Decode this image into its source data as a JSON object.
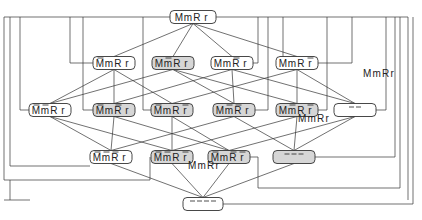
{
  "diagram": {
    "type": "hasse-lattice",
    "colors": {
      "white_node": "#ffffff",
      "gray_node": "#d6d6d6",
      "line": "#333333"
    },
    "nodes": [
      {
        "id": "top",
        "label": "MmRr",
        "bars": [
          0,
          0,
          0,
          0
        ],
        "x": 193,
        "y": 17,
        "w": 46,
        "fill": "white"
      },
      {
        "id": "n1",
        "label": "MmRr",
        "bars": [
          1,
          0,
          0,
          0
        ],
        "x": 114,
        "y": 63,
        "w": 42,
        "fill": "white"
      },
      {
        "id": "n2",
        "label": "MmRr",
        "bars": [
          0,
          1,
          0,
          0
        ],
        "x": 173,
        "y": 63,
        "w": 42,
        "fill": "gray"
      },
      {
        "id": "n3",
        "label": "MmRr",
        "bars": [
          0,
          0,
          1,
          0
        ],
        "x": 232,
        "y": 63,
        "w": 42,
        "fill": "white"
      },
      {
        "id": "n4",
        "label": "MmRr",
        "bars": [
          0,
          0,
          0,
          1
        ],
        "x": 297,
        "y": 63,
        "w": 42,
        "fill": "white"
      },
      {
        "id": "n5",
        "label": "MmRr",
        "bars": [
          1,
          1,
          0,
          0
        ],
        "x": 50,
        "y": 110,
        "w": 42,
        "fill": "white"
      },
      {
        "id": "n6",
        "label": "MmRr",
        "bars": [
          1,
          0,
          1,
          0
        ],
        "x": 114,
        "y": 110,
        "w": 42,
        "fill": "gray"
      },
      {
        "id": "n7",
        "label": "MmRr",
        "bars": [
          1,
          0,
          0,
          1
        ],
        "x": 172,
        "y": 110,
        "w": 42,
        "fill": "gray"
      },
      {
        "id": "n8",
        "label": "MmRr",
        "bars": [
          0,
          1,
          1,
          0
        ],
        "x": 234,
        "y": 110,
        "w": 42,
        "fill": "gray"
      },
      {
        "id": "n9",
        "label": "MmRr",
        "bars": [
          0,
          1,
          0,
          1
        ],
        "x": 297,
        "y": 110,
        "w": 42,
        "fill": "gray"
      },
      {
        "id": "n10",
        "label": "",
        "bars": [],
        "x": 355,
        "y": 110,
        "w": 42,
        "fill": "white",
        "dashes": "– –"
      },
      {
        "id": "n11",
        "label": "MmRr",
        "bars": [
          1,
          1,
          1,
          0
        ],
        "x": 111,
        "y": 157,
        "w": 42,
        "fill": "white"
      },
      {
        "id": "n12",
        "label": "MmRr",
        "bars": [
          1,
          1,
          0,
          1
        ],
        "x": 172,
        "y": 157,
        "w": 42,
        "fill": "gray"
      },
      {
        "id": "n13",
        "label": "MmRr",
        "bars": [
          1,
          0,
          1,
          1
        ],
        "x": 229,
        "y": 157,
        "w": 42,
        "fill": "gray"
      },
      {
        "id": "n14",
        "label": "",
        "bars": [],
        "x": 294,
        "y": 157,
        "w": 42,
        "fill": "gray",
        "dashes": "– – –"
      },
      {
        "id": "bottom",
        "label": "",
        "bars": [],
        "x": 203,
        "y": 204,
        "w": 40,
        "fill": "white",
        "dashes": "– – – –"
      }
    ],
    "free_labels": [
      {
        "text": "MmRr",
        "x": 363,
        "y": 77
      },
      {
        "text": "MmRr",
        "x": 298,
        "y": 122
      },
      {
        "text": "MmRr",
        "x": 188,
        "y": 169
      }
    ],
    "edges": [
      [
        "top",
        "n1"
      ],
      [
        "top",
        "n2"
      ],
      [
        "top",
        "n3"
      ],
      [
        "top",
        "n4"
      ],
      [
        "n1",
        "n5"
      ],
      [
        "n1",
        "n6"
      ],
      [
        "n1",
        "n7"
      ],
      [
        "n2",
        "n5"
      ],
      [
        "n2",
        "n8"
      ],
      [
        "n2",
        "n9"
      ],
      [
        "n3",
        "n6"
      ],
      [
        "n3",
        "n8"
      ],
      [
        "n3",
        "n10"
      ],
      [
        "n4",
        "n7"
      ],
      [
        "n4",
        "n9"
      ],
      [
        "n4",
        "n10"
      ],
      [
        "n5",
        "n11"
      ],
      [
        "n5",
        "n12"
      ],
      [
        "n6",
        "n11"
      ],
      [
        "n6",
        "n13"
      ],
      [
        "n7",
        "n12"
      ],
      [
        "n7",
        "n13"
      ],
      [
        "n8",
        "n11"
      ],
      [
        "n8",
        "n14"
      ],
      [
        "n9",
        "n12"
      ],
      [
        "n9",
        "n14"
      ],
      [
        "n10",
        "n13"
      ],
      [
        "n10",
        "n14"
      ],
      [
        "n11",
        "bottom"
      ],
      [
        "n12",
        "bottom"
      ],
      [
        "n13",
        "bottom"
      ],
      [
        "n14",
        "bottom"
      ]
    ],
    "frame_lines": [
      "M216,17 L408,17 L408,200",
      "M170,17 L4,17 L4,180 L150,180 L150,157",
      "M10,17 L10,166 L90,166",
      "M20,17 L20,110 L29,110",
      "M70,17 L70,63 L93,63",
      "M83,17 L83,110 L93,110",
      "M143,17 L143,110 L151,110",
      "M283,17 L283,63 L318,63",
      "M258,17 L258,63 L253,63",
      "M352,17 L352,63 L318,63",
      "M268,17 L268,110 L255,110",
      "M327,17 L327,110 L318,110",
      "M386,17 L386,110 L376,110",
      "M395,17 L395,157 L315,157",
      "M400,17 L400,188 L258,188 L258,157 L250,157",
      "M413,17 L413,204 L223,204",
      "M4,200 L30,200",
      "M10,180 L10,200"
    ]
  }
}
